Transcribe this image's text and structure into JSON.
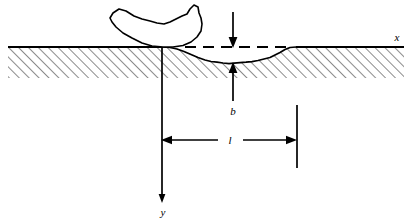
{
  "figure": {
    "type": "engineering-cross-section-diagram",
    "background_color": "#ffffff",
    "line_color": "#000000",
    "hatch_color": "#000000"
  },
  "labels": {
    "x_axis": "x",
    "y_axis": "y",
    "depth": "b",
    "length": "l"
  },
  "elements": {
    "ground_line_name": "ground-surface-line",
    "hatch_name": "soil-hatching",
    "bucket_name": "excavator-bucket",
    "trench_name": "excavated-trench-profile",
    "dashed_name": "original-ground-dashed-line",
    "x_axis_name": "x-axis",
    "y_axis_name": "y-axis",
    "depth_dim_name": "depth-dimension-b",
    "length_dim_name": "length-dimension-l"
  },
  "geometry": {
    "ground_y": 47,
    "hatch_bottom_y": 78,
    "origin_x": 162,
    "y_axis_bottom": 200,
    "dash_start_x": 185,
    "dash_end_x": 288,
    "trench_low_y": 63,
    "l_dim_y": 140,
    "l_left_x": 162,
    "l_right_x": 297,
    "b_x": 233
  }
}
